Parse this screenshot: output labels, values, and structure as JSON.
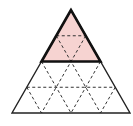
{
  "diagram": {
    "type": "triangular-grid",
    "subdivisions": 4,
    "shaded_rows": 2,
    "colors": {
      "background": "#ffffff",
      "shade": "#f6d3d1",
      "outline": "#222222",
      "dashed": "#333333"
    },
    "geometry": {
      "apex": [
        71,
        10
      ],
      "base_left": [
        12,
        113
      ],
      "base_right": [
        130,
        113
      ]
    }
  }
}
